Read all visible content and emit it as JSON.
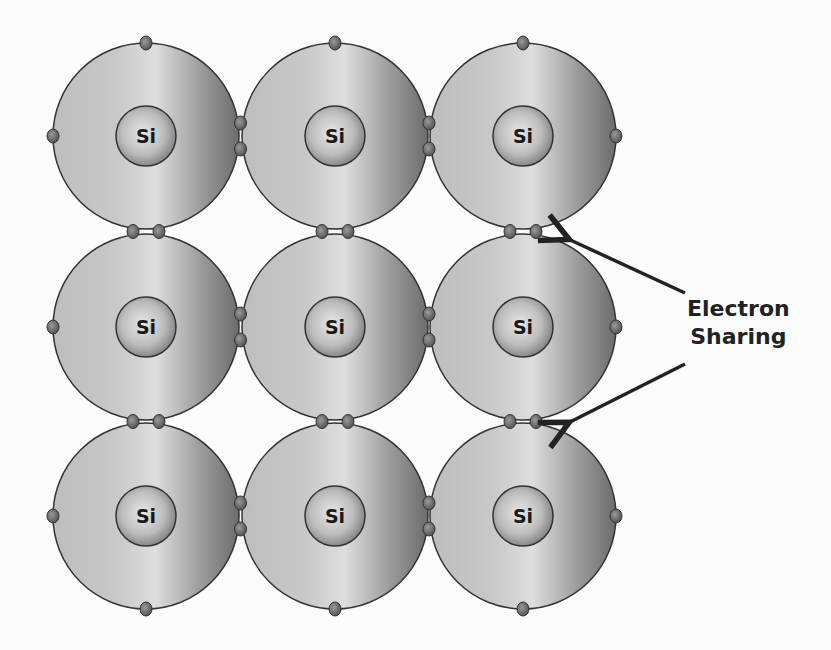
{
  "diagram": {
    "atom_symbol": "Si",
    "grid": {
      "rows": 3,
      "cols": 3
    },
    "atoms": [
      {
        "row": 0,
        "col": 0,
        "label": "Si"
      },
      {
        "row": 0,
        "col": 1,
        "label": "Si"
      },
      {
        "row": 0,
        "col": 2,
        "label": "Si"
      },
      {
        "row": 1,
        "col": 0,
        "label": "Si"
      },
      {
        "row": 1,
        "col": 1,
        "label": "Si"
      },
      {
        "row": 1,
        "col": 2,
        "label": "Si"
      },
      {
        "row": 2,
        "col": 0,
        "label": "Si"
      },
      {
        "row": 2,
        "col": 1,
        "label": "Si"
      },
      {
        "row": 2,
        "col": 2,
        "label": "Si"
      }
    ],
    "annotation": {
      "line1": "Electron",
      "line2": "Sharing",
      "arrow_count": 2
    },
    "colors": {
      "shell_light": "#d0d0d0",
      "shell_dark": "#6e6e6e",
      "outline": "#333333",
      "electron": "#6a6a6a",
      "text": "#222222"
    }
  }
}
